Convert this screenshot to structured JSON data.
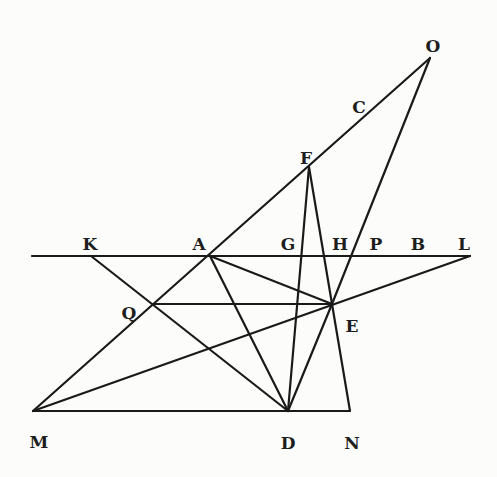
{
  "diagram": {
    "type": "geometric construction",
    "points": {
      "O": {
        "x": 430,
        "y": 58,
        "label_x": 433,
        "label_y": 46
      },
      "C": {
        "x": 372,
        "y": 101,
        "label_x": 359,
        "label_y": 107
      },
      "F": {
        "x": 309,
        "y": 167,
        "label_x": 306,
        "label_y": 158
      },
      "K": {
        "x": 91,
        "y": 256,
        "label_x": 90,
        "label_y": 244
      },
      "A": {
        "x": 210,
        "y": 256,
        "label_x": 199,
        "label_y": 244
      },
      "G": {
        "x": 301,
        "y": 256,
        "label_x": 288,
        "label_y": 244
      },
      "H": {
        "x": 324,
        "y": 256,
        "label_x": 340,
        "label_y": 244
      },
      "P": {
        "x": 351,
        "y": 256,
        "label_x": 376,
        "label_y": 244
      },
      "B": {
        "x": 410,
        "y": 256,
        "label_x": 418,
        "label_y": 244
      },
      "L": {
        "x": 470,
        "y": 256,
        "label_x": 464,
        "label_y": 244
      },
      "Q": {
        "x": 153,
        "y": 304,
        "label_x": 129,
        "label_y": 313
      },
      "E": {
        "x": 332,
        "y": 304,
        "label_x": 352,
        "label_y": 326
      },
      "M": {
        "x": 33,
        "y": 411,
        "label_x": 39,
        "label_y": 442
      },
      "D": {
        "x": 288,
        "y": 411,
        "label_x": 288,
        "label_y": 443
      },
      "N": {
        "x": 350,
        "y": 411,
        "label_x": 352,
        "label_y": 443
      }
    },
    "labels": [
      "O",
      "C",
      "F",
      "K",
      "A",
      "G",
      "H",
      "P",
      "B",
      "L",
      "Q",
      "E",
      "M",
      "D",
      "N"
    ],
    "segments": [
      {
        "name": "line-M-O",
        "from": "M",
        "to": "O",
        "x1": 33,
        "y1": 411,
        "x2": 430,
        "y2": 58
      },
      {
        "name": "line-K-L",
        "from": "K",
        "to": "L",
        "x1": 32,
        "y1": 256,
        "x2": 470,
        "y2": 256
      },
      {
        "name": "line-M-L",
        "from": "M",
        "to": "L",
        "x1": 33,
        "y1": 411,
        "x2": 470,
        "y2": 256
      },
      {
        "name": "line-M-N",
        "from": "M",
        "to": "N",
        "x1": 33,
        "y1": 411,
        "x2": 350,
        "y2": 411
      },
      {
        "name": "line-K-D",
        "from": "K",
        "to": "D",
        "x1": 91,
        "y1": 256,
        "x2": 288,
        "y2": 411
      },
      {
        "name": "line-Q-E",
        "from": "Q",
        "to": "E",
        "x1": 153,
        "y1": 304,
        "x2": 332,
        "y2": 304
      },
      {
        "name": "line-A-E",
        "from": "A",
        "to": "E",
        "x1": 210,
        "y1": 256,
        "x2": 332,
        "y2": 304
      },
      {
        "name": "line-A-D",
        "from": "A",
        "to": "D",
        "x1": 210,
        "y1": 256,
        "x2": 288,
        "y2": 411
      },
      {
        "name": "line-F-D",
        "from": "F",
        "to": "D",
        "x1": 309,
        "y1": 167,
        "x2": 288,
        "y2": 411
      },
      {
        "name": "line-F-E",
        "from": "F",
        "to": "E",
        "x1": 309,
        "y1": 167,
        "x2": 332,
        "y2": 304
      },
      {
        "name": "line-O-E",
        "from": "O",
        "to": "E",
        "x1": 430,
        "y1": 58,
        "x2": 332,
        "y2": 304
      },
      {
        "name": "line-E-D",
        "from": "E",
        "to": "D",
        "x1": 332,
        "y1": 304,
        "x2": 288,
        "y2": 411
      },
      {
        "name": "line-E-N",
        "from": "E",
        "to": "N",
        "x1": 332,
        "y1": 304,
        "x2": 350,
        "y2": 411
      }
    ]
  }
}
